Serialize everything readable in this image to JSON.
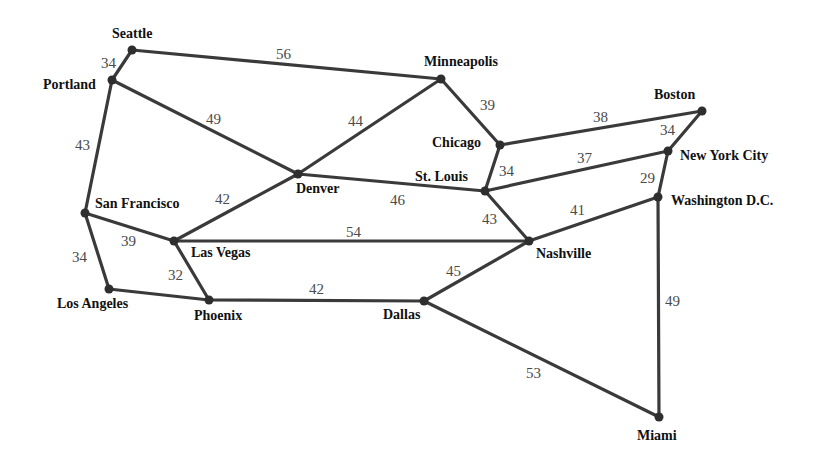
{
  "diagram": {
    "type": "weighted-graph",
    "colors": {
      "edge": "#3a3a3a",
      "node": "#2e2e2e",
      "city_text": "#111111",
      "weight_text": "#4a4a4a",
      "background": "#ffffff"
    },
    "nodes": [
      {
        "id": "seattle",
        "label": "Seattle",
        "x": 132,
        "y": 50,
        "lx": 112,
        "ly": 38,
        "anchor": "start"
      },
      {
        "id": "portland",
        "label": "Portland",
        "x": 112,
        "y": 80,
        "lx": 43,
        "ly": 89,
        "anchor": "start"
      },
      {
        "id": "minneapolis",
        "label": "Minneapolis",
        "x": 441,
        "y": 79,
        "lx": 424,
        "ly": 66,
        "anchor": "start"
      },
      {
        "id": "boston",
        "label": "Boston",
        "x": 702,
        "y": 111,
        "lx": 654,
        "ly": 99,
        "anchor": "start"
      },
      {
        "id": "chicago",
        "label": "Chicago",
        "x": 500,
        "y": 145,
        "lx": 432,
        "ly": 147,
        "anchor": "start"
      },
      {
        "id": "new-york-city",
        "label": "New York City",
        "x": 668,
        "y": 151,
        "lx": 680,
        "ly": 160,
        "anchor": "start"
      },
      {
        "id": "denver",
        "label": "Denver",
        "x": 298,
        "y": 174,
        "lx": 296,
        "ly": 193,
        "anchor": "start"
      },
      {
        "id": "st-louis",
        "label": "St. Louis",
        "x": 485,
        "y": 191,
        "lx": 415,
        "ly": 181,
        "anchor": "start"
      },
      {
        "id": "washington-dc",
        "label": "Washington D.C.",
        "x": 658,
        "y": 197,
        "lx": 671,
        "ly": 205,
        "anchor": "start"
      },
      {
        "id": "san-francisco",
        "label": "San Francisco",
        "x": 85,
        "y": 213,
        "lx": 95,
        "ly": 208,
        "anchor": "start"
      },
      {
        "id": "las-vegas",
        "label": "Las Vegas",
        "x": 174,
        "y": 241,
        "lx": 191,
        "ly": 257,
        "anchor": "start"
      },
      {
        "id": "nashville",
        "label": "Nashville",
        "x": 529,
        "y": 241,
        "lx": 536,
        "ly": 258,
        "anchor": "start"
      },
      {
        "id": "los-angeles",
        "label": "Los Angeles",
        "x": 109,
        "y": 289,
        "lx": 57,
        "ly": 308,
        "anchor": "start"
      },
      {
        "id": "phoenix",
        "label": "Phoenix",
        "x": 209,
        "y": 300,
        "lx": 194,
        "ly": 320,
        "anchor": "start"
      },
      {
        "id": "dallas",
        "label": "Dallas",
        "x": 424,
        "y": 301,
        "lx": 383,
        "ly": 319,
        "anchor": "start"
      },
      {
        "id": "miami",
        "label": "Miami",
        "x": 659,
        "y": 417,
        "lx": 637,
        "ly": 440,
        "anchor": "start"
      }
    ],
    "edges": [
      {
        "from": "seattle",
        "to": "portland",
        "weight": "34",
        "wx": 101,
        "wy": 68
      },
      {
        "from": "seattle",
        "to": "minneapolis",
        "weight": "56",
        "wx": 276,
        "wy": 59
      },
      {
        "from": "portland",
        "to": "san-francisco",
        "weight": "43",
        "wx": 75,
        "wy": 150
      },
      {
        "from": "portland",
        "to": "denver",
        "weight": "49",
        "wx": 206,
        "wy": 124
      },
      {
        "from": "minneapolis",
        "to": "denver",
        "weight": "44",
        "wx": 348,
        "wy": 126
      },
      {
        "from": "minneapolis",
        "to": "chicago",
        "weight": "39",
        "wx": 480,
        "wy": 110
      },
      {
        "from": "chicago",
        "to": "boston",
        "weight": "38",
        "wx": 593,
        "wy": 122
      },
      {
        "from": "chicago",
        "to": "st-louis",
        "weight": "34",
        "wx": 499,
        "wy": 176
      },
      {
        "from": "boston",
        "to": "new-york-city",
        "weight": "34",
        "wx": 660,
        "wy": 135
      },
      {
        "from": "st-louis",
        "to": "new-york-city",
        "weight": "37",
        "wx": 577,
        "wy": 163
      },
      {
        "from": "new-york-city",
        "to": "washington-dc",
        "weight": "29",
        "wx": 640,
        "wy": 183
      },
      {
        "from": "denver",
        "to": "st-louis",
        "weight": "46",
        "wx": 390,
        "wy": 205
      },
      {
        "from": "denver",
        "to": "las-vegas",
        "weight": "42",
        "wx": 215,
        "wy": 204
      },
      {
        "from": "st-louis",
        "to": "nashville",
        "weight": "43",
        "wx": 482,
        "wy": 224
      },
      {
        "from": "washington-dc",
        "to": "nashville",
        "weight": "41",
        "wx": 570,
        "wy": 215
      },
      {
        "from": "washington-dc",
        "to": "miami",
        "weight": "49",
        "wx": 665,
        "wy": 306
      },
      {
        "from": "san-francisco",
        "to": "las-vegas",
        "weight": "39",
        "wx": 121,
        "wy": 246
      },
      {
        "from": "san-francisco",
        "to": "los-angeles",
        "weight": "34",
        "wx": 72,
        "wy": 262
      },
      {
        "from": "las-vegas",
        "to": "nashville",
        "weight": "54",
        "wx": 346,
        "wy": 237
      },
      {
        "from": "las-vegas",
        "to": "phoenix",
        "weight": "32",
        "wx": 168,
        "wy": 280
      },
      {
        "from": "los-angeles",
        "to": "phoenix",
        "weight": "",
        "wx": 0,
        "wy": 0
      },
      {
        "from": "phoenix",
        "to": "dallas",
        "weight": "42",
        "wx": 309,
        "wy": 294
      },
      {
        "from": "dallas",
        "to": "nashville",
        "weight": "45",
        "wx": 446,
        "wy": 276
      },
      {
        "from": "dallas",
        "to": "miami",
        "weight": "53",
        "wx": 526,
        "wy": 378
      }
    ]
  }
}
